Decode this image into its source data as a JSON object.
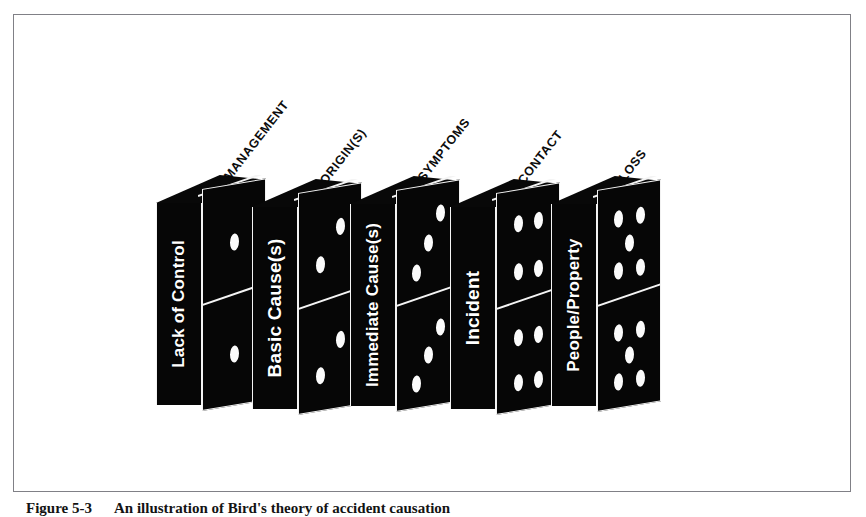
{
  "figure": {
    "caption_label": "Figure 5-3",
    "caption_text": "An illustration of Bird's theory of accident causation",
    "frame_color": "#808086",
    "domino_color": "#060606",
    "pip_color": "#fbfbfb",
    "label_color": "#ffffff",
    "tag_color": "#0c0c0c"
  },
  "diagram": {
    "type": "domino-sequence",
    "dominoes": [
      {
        "label": "Lack of Control",
        "tag": "MANAGEMENT",
        "pips_top": 1,
        "pips_bottom": 1
      },
      {
        "label": "Basic Cause(s)",
        "tag": "ORIGIN(S)",
        "pips_top": 2,
        "pips_bottom": 2
      },
      {
        "label": "Immediate Cause(s)",
        "tag": "SYMPTOMS",
        "pips_top": 3,
        "pips_bottom": 3
      },
      {
        "label": "Incident",
        "tag": "CONTACT",
        "pips_top": 4,
        "pips_bottom": 4
      },
      {
        "label": "People/Property",
        "tag": "LOSS",
        "pips_top": 5,
        "pips_bottom": 5
      }
    ]
  }
}
